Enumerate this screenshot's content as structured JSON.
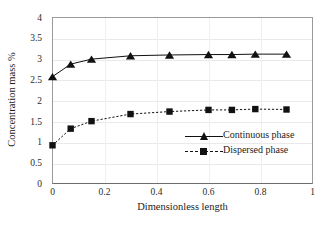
{
  "chart_data": {
    "type": "line",
    "title": "",
    "xlabel": "Dimensionless length",
    "ylabel": "Concentration mass %",
    "xlim": [
      0,
      1
    ],
    "ylim": [
      0,
      4
    ],
    "xticks": [
      "0",
      "0.2",
      "0.4",
      "0.6",
      "0.8",
      "1"
    ],
    "xtick_values": [
      0,
      0.2,
      0.4,
      0.6,
      0.8,
      1
    ],
    "yticks": [
      "0",
      "0.5",
      "1",
      "1.5",
      "2",
      "2.5",
      "3",
      "3.5",
      "4"
    ],
    "ytick_values": [
      0,
      0.5,
      1,
      1.5,
      2,
      2.5,
      3,
      3.5,
      4
    ],
    "grid": "horizontal-and-vertical-light",
    "legend_position": "inside-lower-right",
    "series": [
      {
        "name": "Continuous phase",
        "marker": "triangle",
        "line_style": "solid",
        "color": "#111111",
        "x": [
          0,
          0.07,
          0.15,
          0.3,
          0.45,
          0.6,
          0.69,
          0.78,
          0.9
        ],
        "values": [
          2.58,
          2.88,
          3.0,
          3.08,
          3.1,
          3.11,
          3.11,
          3.12,
          3.12
        ]
      },
      {
        "name": "Dispersed phase",
        "marker": "square",
        "line_style": "dashed",
        "color": "#111111",
        "x": [
          0,
          0.07,
          0.15,
          0.3,
          0.45,
          0.6,
          0.69,
          0.78,
          0.9
        ],
        "values": [
          0.93,
          1.33,
          1.51,
          1.68,
          1.74,
          1.78,
          1.78,
          1.8,
          1.79
        ]
      }
    ]
  },
  "legend": {
    "entries": [
      {
        "label": "Continuous phase"
      },
      {
        "label": "Dispersed phase"
      }
    ]
  }
}
